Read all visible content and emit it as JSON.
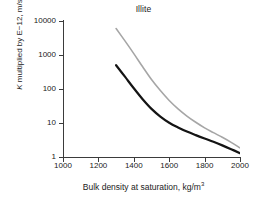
{
  "chart_data": {
    "type": "line",
    "title": "Illite",
    "xlabel": "Bulk density at saturation, kg/m",
    "xlabel_sup": "3",
    "ylabel_prefix": "K",
    "ylabel_rest": " multiplied by E−12, m/s",
    "ylabel_full": "K multiplied by E−12, m/s",
    "xlim": [
      1000,
      2000
    ],
    "ylim": [
      1,
      10000
    ],
    "yscale": "log",
    "xscale": "linear",
    "xticks": [
      1000,
      1200,
      1400,
      1600,
      1800,
      2000
    ],
    "xticklabels": [
      "1000",
      "1200",
      "1400",
      "1600",
      "1800",
      "2000"
    ],
    "yticks": [
      1,
      10,
      100,
      1000,
      10000
    ],
    "yticklabels": [
      "1",
      "10",
      "100",
      "1000",
      "10000"
    ],
    "grid": false,
    "legend": "none",
    "series": [
      {
        "name": "upper-curve",
        "color": "#a6a6a6",
        "width": 1.6,
        "x": [
          1300,
          1350,
          1400,
          1450,
          1500,
          1550,
          1600,
          1650,
          1700,
          1750,
          1800,
          1850,
          1900,
          1950,
          2000
        ],
        "y": [
          6000,
          2600,
          1100,
          450,
          190,
          90,
          46,
          26,
          16,
          10.5,
          7.2,
          5.2,
          3.8,
          2.7,
          1.85
        ]
      },
      {
        "name": "lower-curve",
        "color": "#141414",
        "width": 2.2,
        "x": [
          1300,
          1350,
          1400,
          1450,
          1500,
          1550,
          1600,
          1650,
          1700,
          1750,
          1800,
          1850,
          1900,
          1950,
          2000
        ],
        "y": [
          500,
          230,
          105,
          50,
          26,
          15.5,
          10.2,
          7.4,
          5.6,
          4.4,
          3.5,
          2.8,
          2.2,
          1.7,
          1.3
        ]
      }
    ]
  },
  "axes": {
    "tick_color": "#3b3b3b",
    "background": "#ffffff"
  }
}
